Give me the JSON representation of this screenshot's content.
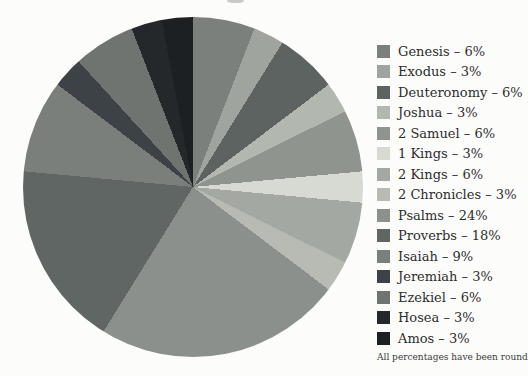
{
  "chart_data": {
    "type": "pie",
    "title": "",
    "note": "All percentages have been rounded.",
    "legend_position": "right",
    "start_angle_deg": 0,
    "direction": "clockwise",
    "values_sum_pct": 102,
    "label_separator": "–",
    "slices": [
      {
        "label": "Genesis",
        "pct": 6,
        "color": "#7b807c"
      },
      {
        "label": "Exodus",
        "pct": 3,
        "color": "#9fa49f"
      },
      {
        "label": "Deuteronomy",
        "pct": 6,
        "color": "#5d6360"
      },
      {
        "label": "Joshua",
        "pct": 3,
        "color": "#b2b7b0"
      },
      {
        "label": "2 Samuel",
        "pct": 6,
        "color": "#8f948f"
      },
      {
        "label": "1 Kings",
        "pct": 3,
        "color": "#d7dad3"
      },
      {
        "label": "2 Kings",
        "pct": 6,
        "color": "#a4a8a2"
      },
      {
        "label": "2 Chronicles",
        "pct": 3,
        "color": "#b7bbb4"
      },
      {
        "label": "Psalms",
        "pct": 24,
        "color": "#8b908c"
      },
      {
        "label": "Proverbs",
        "pct": 18,
        "color": "#606663"
      },
      {
        "label": "Isaiah",
        "pct": 9,
        "color": "#7a7f7b"
      },
      {
        "label": "Jeremiah",
        "pct": 3,
        "color": "#3c4245"
      },
      {
        "label": "Ezekiel",
        "pct": 6,
        "color": "#6f7471"
      },
      {
        "label": "Hosea",
        "pct": 3,
        "color": "#25282b"
      },
      {
        "label": "Amos",
        "pct": 3,
        "color": "#1d2023"
      }
    ],
    "page_background": "#fcfcfb",
    "legend_text_color": "#2d2d2d"
  }
}
